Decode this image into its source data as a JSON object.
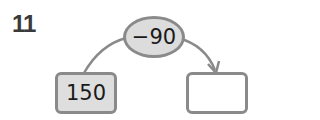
{
  "problem_number": "11",
  "operation": {
    "label": "−90"
  },
  "input_box": {
    "value": "150"
  },
  "output_box": {
    "value": ""
  },
  "colors": {
    "border": "#8a8a8a",
    "fill": "#dcdcdc",
    "text": "#1a1a1a"
  }
}
